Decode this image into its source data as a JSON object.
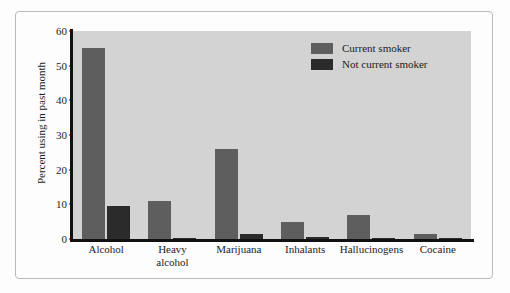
{
  "chart_data": {
    "type": "bar",
    "title": "",
    "xlabel": "",
    "ylabel": "Percent using in past month",
    "ylim": [
      0,
      60
    ],
    "yticks": [
      0,
      10,
      20,
      30,
      40,
      50,
      60
    ],
    "grid": false,
    "legend_position": "top-right",
    "categories": [
      "Alcohol",
      "Heavy alcohol",
      "Marijuana",
      "Inhalants",
      "Hallucinogens",
      "Cocaine"
    ],
    "category_lines": [
      [
        "Alcohol"
      ],
      [
        "Heavy",
        "alcohol"
      ],
      [
        "Marijuana"
      ],
      [
        "Inhalants"
      ],
      [
        "Hallucinogens"
      ],
      [
        "Cocaine"
      ]
    ],
    "series": [
      {
        "name": "Current smoker",
        "color": "#5e5e5e",
        "values": [
          55,
          11,
          26,
          5,
          7,
          1.5
        ]
      },
      {
        "name": "Not current smoker",
        "color": "#2b2b2b",
        "values": [
          9.5,
          0.4,
          1.5,
          0.5,
          0.4,
          0.2
        ]
      }
    ]
  },
  "legend": {
    "items": [
      {
        "label": "Current smoker"
      },
      {
        "label": "Not current smoker"
      }
    ]
  }
}
